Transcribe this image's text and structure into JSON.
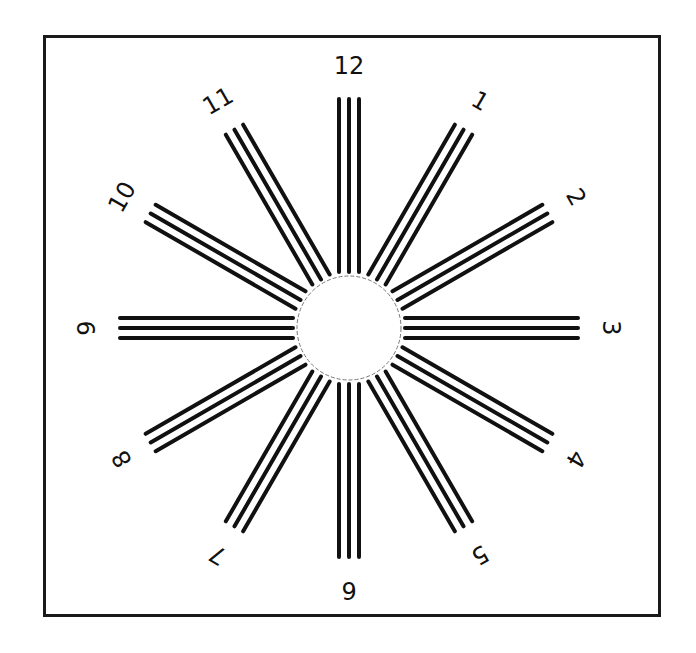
{
  "chart": {
    "center": {
      "x": 349,
      "y": 328
    },
    "circle_radius": 52,
    "ray_inner_radius": 56,
    "ray_outer_radius": 229,
    "line_spacing": 10,
    "line_width": 4,
    "label_radius": 262,
    "colors": {
      "ink": "#111111",
      "background": "#ffffff",
      "circle_stroke": "#777777"
    },
    "labels": [
      "12",
      "1",
      "2",
      "3",
      "4",
      "5",
      "6",
      "7",
      "8",
      "9",
      "10",
      "11"
    ]
  }
}
